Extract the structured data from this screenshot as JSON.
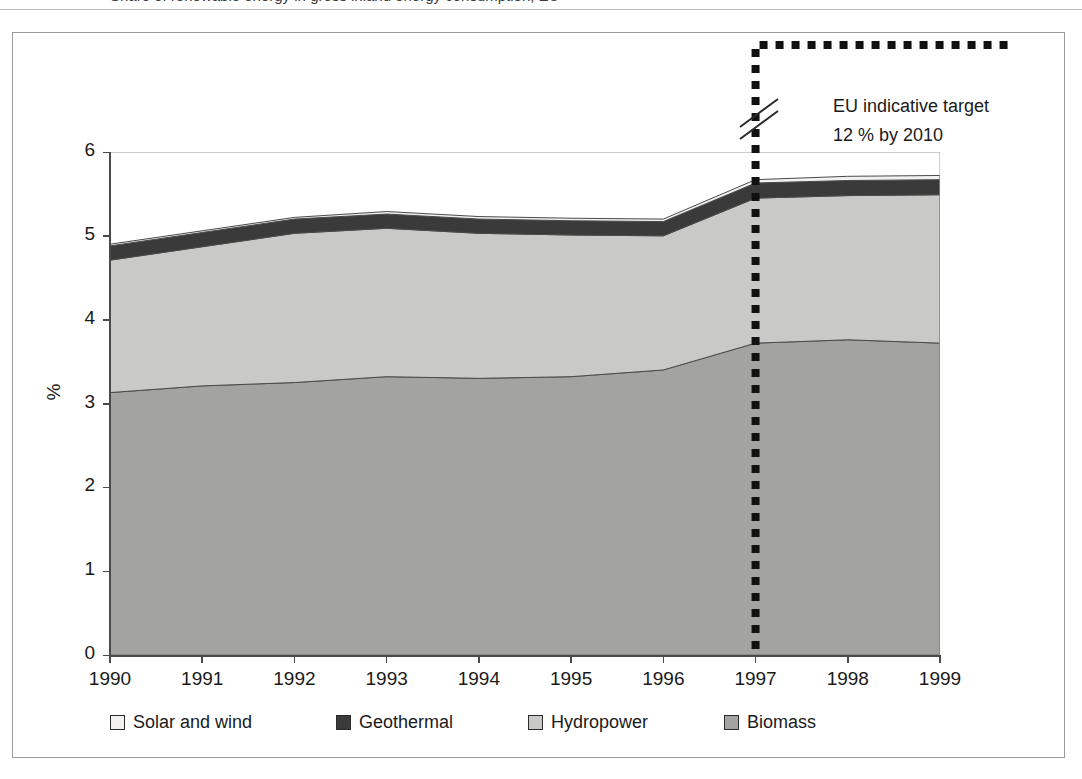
{
  "caption": {
    "text": "Share of renewable energy in gross inland energy consumption, EU"
  },
  "annotation": {
    "line1": "EU indicative target",
    "line2": "12 % by 2010",
    "break_year": 1997
  },
  "axes": {
    "y_title": "%",
    "y_ticks": [
      "0",
      "1",
      "2",
      "3",
      "4",
      "5",
      "6"
    ],
    "y_min": 0,
    "y_max": 6,
    "x_ticks": [
      "1990",
      "1991",
      "1992",
      "1993",
      "1994",
      "1995",
      "1996",
      "1997",
      "1998",
      "1999"
    ]
  },
  "legend": {
    "items": [
      {
        "label": "Solar and wind",
        "color": "#f2f1ef"
      },
      {
        "label": "Geothermal",
        "color": "#3a3a3a"
      },
      {
        "label": "Hydropower",
        "color": "#c9c9c7"
      },
      {
        "label": "Biomass",
        "color": "#a3a3a1"
      }
    ]
  },
  "chart_data": {
    "type": "area",
    "title": "Share of renewable energy in gross inland energy consumption, EU",
    "xlabel": "",
    "ylabel": "%",
    "ylim": [
      0,
      6
    ],
    "xlim": [
      1990,
      1999
    ],
    "grid": false,
    "stacked": true,
    "legend_position": "bottom",
    "categories": [
      1990,
      1991,
      1992,
      1993,
      1994,
      1995,
      1996,
      1997,
      1998,
      1999
    ],
    "series": [
      {
        "name": "Biomass",
        "values": [
          3.13,
          3.21,
          3.25,
          3.32,
          3.3,
          3.32,
          3.4,
          3.72,
          3.76,
          3.72
        ]
      },
      {
        "name": "Hydropower",
        "values": [
          1.58,
          1.66,
          1.78,
          1.77,
          1.73,
          1.69,
          1.6,
          1.73,
          1.72,
          1.77
        ]
      },
      {
        "name": "Geothermal",
        "values": [
          0.17,
          0.17,
          0.17,
          0.17,
          0.17,
          0.17,
          0.17,
          0.18,
          0.18,
          0.18
        ]
      },
      {
        "name": "Solar and wind",
        "values": [
          0.02,
          0.02,
          0.02,
          0.03,
          0.03,
          0.03,
          0.03,
          0.04,
          0.05,
          0.05
        ]
      }
    ],
    "totals": [
      4.9,
      5.06,
      5.22,
      5.29,
      5.23,
      5.21,
      5.2,
      5.67,
      5.71,
      5.72
    ],
    "annotations": [
      {
        "text": "EU indicative target 12 % by 2010",
        "at_year": 1997,
        "type": "dashed-target-line"
      }
    ]
  }
}
